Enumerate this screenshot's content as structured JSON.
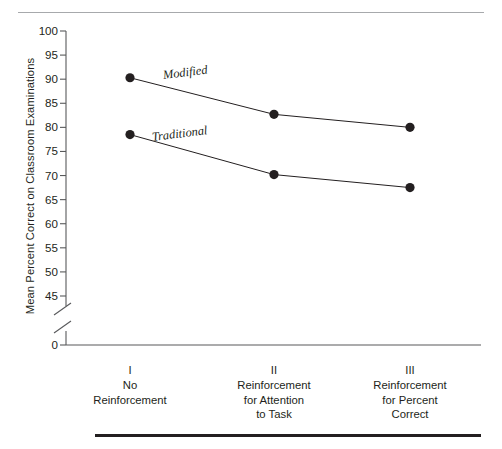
{
  "chart_data": {
    "type": "line",
    "title": "",
    "xlabel": "",
    "ylabel": "Mean Percent Correct on Classroom Examinations",
    "ylim": [
      45,
      100
    ],
    "yticks": [
      45,
      50,
      55,
      60,
      65,
      70,
      75,
      80,
      85,
      90,
      95,
      100
    ],
    "ytick_labels": [
      "45",
      "50",
      "55",
      "60",
      "65",
      "70",
      "75",
      "80",
      "85",
      "90",
      "95",
      "100"
    ],
    "axis_break": true,
    "zero_tick_label": "0",
    "grid": false,
    "legend_position": "inline",
    "categories": [
      "I",
      "II",
      "III"
    ],
    "category_descriptions": [
      [
        "No",
        "Reinforcement"
      ],
      [
        "Reinforcement",
        "for Attention",
        "to Task"
      ],
      [
        "Reinforcement",
        "for Percent",
        "Correct"
      ]
    ],
    "series": [
      {
        "name": "Modified",
        "values": [
          90.3,
          82.7,
          80.0
        ]
      },
      {
        "name": "Traditional",
        "values": [
          78.5,
          70.2,
          67.5
        ]
      }
    ],
    "colors": {
      "line": "#231f20",
      "marker": "#231f20",
      "axis": "#58595b",
      "text": "#231f20",
      "rule_top": "#a7a9ac",
      "rule_bottom": "#231f20"
    }
  }
}
